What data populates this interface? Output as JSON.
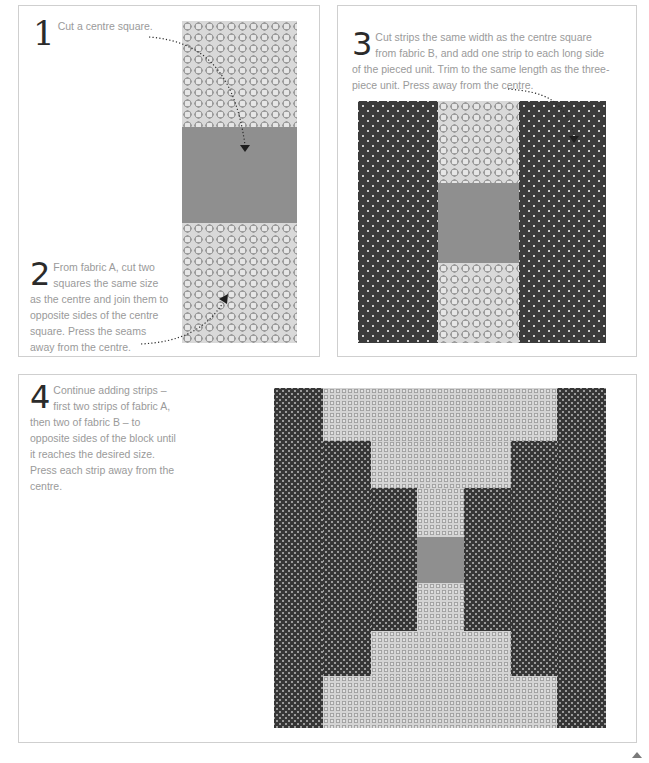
{
  "steps": [
    {
      "number": "1",
      "text": "Cut a centre square."
    },
    {
      "number": "2",
      "text": "From fabric A, cut two squares the same size as the centre and join them to opposite sides of the centre square. Press the seams away from the centre."
    },
    {
      "number": "3",
      "text": "Cut strips the same width as the centre square from fabric B, and add one strip to each long side of the pieced unit. Trim to the same length as the three-piece unit. Press away from the centre."
    },
    {
      "number": "4",
      "text": "Continue adding strips – first two strips of fabric A, then two of fabric B – to opposite sides of the block until it reaches the desired size. Press each strip away from the centre."
    }
  ],
  "fabrics": {
    "fabric_a": {
      "name": "Fabric A",
      "pattern": "grey circles on light grey",
      "color": "#d9d9d9"
    },
    "fabric_b": {
      "name": "Fabric B",
      "pattern": "white dots on charcoal",
      "color": "#3b3b3b"
    },
    "centre": {
      "name": "Centre square",
      "pattern": "plain grey",
      "color": "#8f8f8f"
    }
  },
  "icons": {
    "arrow": "dotted-arrow-icon",
    "corner": "page-corner-icon"
  }
}
